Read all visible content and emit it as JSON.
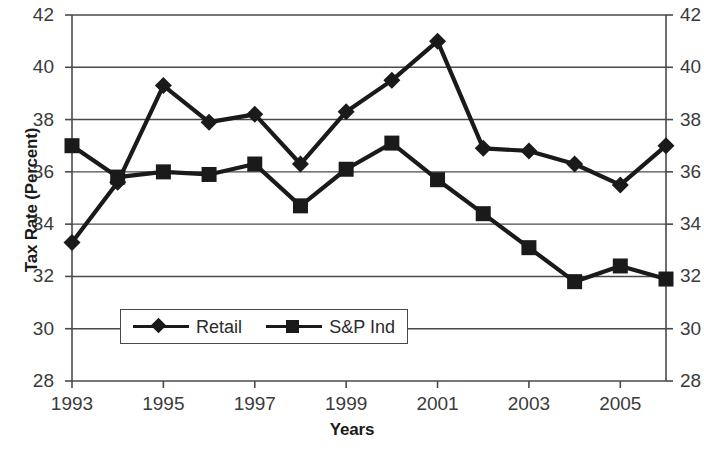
{
  "chart_data": {
    "type": "line",
    "title": "",
    "xlabel": "Years",
    "ylabel": "Tax Rate (Percent)",
    "x": [
      1993,
      1994,
      1995,
      1996,
      1997,
      1998,
      1999,
      2000,
      2001,
      2002,
      2003,
      2004,
      2005,
      2006
    ],
    "categories": [
      "1993",
      "1994",
      "1995",
      "1996",
      "1997",
      "1998",
      "1999",
      "2000",
      "2001",
      "2002",
      "2003",
      "2004",
      "2005",
      "2006"
    ],
    "series": [
      {
        "name": "Retail",
        "marker": "diamond",
        "color": "#1a1a1a",
        "values": [
          33.3,
          35.6,
          39.3,
          37.9,
          38.2,
          36.3,
          38.3,
          39.5,
          41.0,
          36.9,
          36.8,
          36.3,
          35.5,
          37.0
        ]
      },
      {
        "name": "S&P Ind",
        "marker": "square",
        "color": "#1a1a1a",
        "values": [
          37.0,
          35.8,
          36.0,
          35.9,
          36.3,
          34.7,
          36.1,
          37.1,
          35.7,
          34.4,
          33.1,
          31.8,
          32.4,
          31.9
        ]
      }
    ],
    "xlim": [
      1993,
      2006
    ],
    "ylim": [
      28,
      42
    ],
    "yticks": [
      28,
      30,
      32,
      34,
      36,
      38,
      40,
      42
    ],
    "ytick_labels_left": [
      "28",
      "30",
      "32",
      "34",
      "36",
      "38",
      "40",
      "42"
    ],
    "ytick_labels_right": [
      "28",
      "30",
      "32",
      "34",
      "36",
      "38",
      "40",
      "42"
    ],
    "xticks": [
      1993,
      1995,
      1997,
      1999,
      2001,
      2003,
      2005
    ],
    "xtick_labels": [
      "1993",
      "1995",
      "1997",
      "1999",
      "2001",
      "2003",
      "2005"
    ],
    "grid": "horizontal",
    "legend_position": "inside-bottom-left",
    "legend_entries": [
      "Retail",
      "S&P Ind"
    ],
    "axis_color": "#4a4a4a",
    "grid_color": "#4a4a4a",
    "background": "#ffffff"
  }
}
